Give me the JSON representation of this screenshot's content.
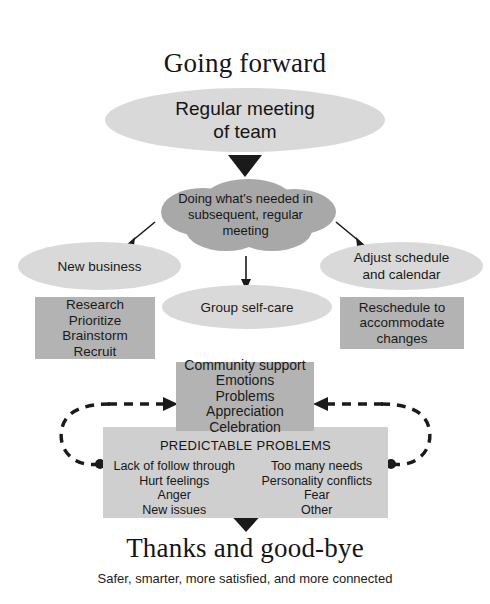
{
  "headings": {
    "top": "Going forward",
    "bottom": "Thanks and good-bye",
    "tagline": "Safer, smarter, more satisfied, and more connected"
  },
  "nodes": {
    "regular_meeting": "Regular meeting\nof team",
    "doing_whats_needed": "Doing what's needed in\nsubsequent, regular\nmeeting",
    "new_business": "New business",
    "adjust_schedule": "Adjust schedule\nand calendar",
    "group_self_care": "Group self-care",
    "research_box": "Research\nPrioritize\nBrainstorm\nRecruit",
    "reschedule_box": "Reschedule to\naccommodate\nchanges",
    "community_support_box": "Community support\nEmotions\nProblems\nAppreciation\nCelebration"
  },
  "predictable_problems": {
    "title": "PREDICTABLE PROBLEMS",
    "left_column": "Lack of follow through\nHurt feelings\nAnger\nNew issues",
    "right_column": "Too many needs\nPersonality conflicts\nFear\nOther"
  },
  "colors": {
    "ellipse_light": "#d9d9d9",
    "cloud_dark": "#a8a8a8",
    "box_gray": "#b3b3b3",
    "box_light": "#cfcfcf",
    "arrow": "#1a1a1a",
    "background": "#ffffff",
    "text": "#1a1a1a"
  },
  "connectors": {
    "arrow_meeting_to_cloud": "triangle-down-arrow",
    "arrow_cloud_to_new_business": "diagonal-arrow-left",
    "arrow_cloud_to_adjust_schedule": "diagonal-arrow-right",
    "arrow_cloud_to_group_selfcare": "straight-arrow-down",
    "arrow_community_to_problems": "triangle-down-arrow",
    "arrow_problems_to_thanks": "triangle-down-arrow",
    "feedback_loop_left": "dashed-curved-arrow",
    "feedback_loop_right": "dashed-curved-arrow"
  }
}
